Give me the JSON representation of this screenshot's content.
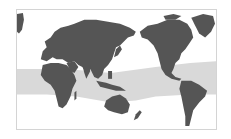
{
  "map": {
    "projection": "pacific-centered world map",
    "colors": {
      "background": "#ffffff",
      "land": "#555555",
      "band": "#d9d9d9",
      "frame": "#d4d4d4"
    },
    "highlight_band": {
      "description": "tropical belt shaded light gray"
    },
    "regions": [
      "Europe",
      "Africa",
      "Asia",
      "Australia",
      "North America",
      "South America",
      "Greenland"
    ]
  }
}
